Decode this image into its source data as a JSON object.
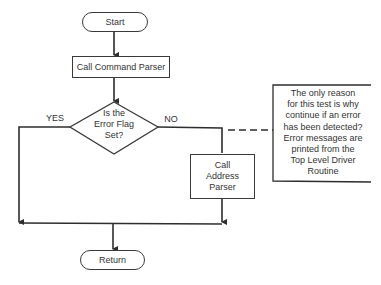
{
  "flowchart": {
    "start": "Start",
    "step1": "Call Command Parser",
    "decision": [
      "Is the",
      "Error Flag",
      "Set?"
    ],
    "branch_yes": "YES",
    "branch_no": "NO",
    "step2": [
      "Call",
      "Address",
      "Parser"
    ],
    "end": "Return"
  },
  "annotation": {
    "lines": [
      "The only reason",
      "for this test is why",
      "continue if an error",
      "has been detected?",
      "Error messages are",
      "printed from the",
      "Top Level Driver",
      "Routine"
    ]
  },
  "colors": {
    "stroke": "#3a3a3a",
    "text": "#333333",
    "background": "#ffffff"
  }
}
